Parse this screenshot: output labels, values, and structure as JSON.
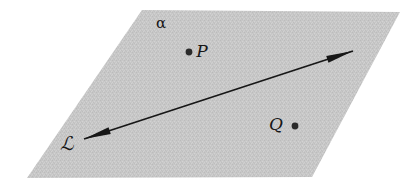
{
  "figure": {
    "type": "geometry-diagram",
    "background_color": "#ffffff",
    "ink_color": "#171717"
  },
  "plane": {
    "name": "plane-alpha",
    "label": "α",
    "fill_color": "#c8c8c8",
    "texture": "dithered-halftone",
    "corners": [
      {
        "name": "top-left",
        "x": 142,
        "y": 10
      },
      {
        "name": "top-right",
        "x": 400,
        "y": 12
      },
      {
        "name": "bottom-right",
        "x": 312,
        "y": 177
      },
      {
        "name": "bottom-left",
        "x": 27,
        "y": 178
      }
    ],
    "label_position": {
      "x": 161,
      "y": 23
    }
  },
  "points": [
    {
      "name": "point-P",
      "label": "P",
      "dot": {
        "x": 189,
        "y": 52,
        "r": 3.4
      },
      "label_position": {
        "x": 202,
        "y": 51
      },
      "label_side": "right"
    },
    {
      "name": "point-Q",
      "label": "Q",
      "dot": {
        "x": 295,
        "y": 126,
        "r": 3.4
      },
      "label_position": {
        "x": 276,
        "y": 124
      },
      "label_side": "left"
    }
  ],
  "line": {
    "name": "line-L",
    "label": "ℒ",
    "label_position": {
      "x": 67,
      "y": 143
    },
    "stroke_color": "#171717",
    "stroke_width": 1.8,
    "arrowheads": "both",
    "start": {
      "x": 84,
      "y": 139
    },
    "end": {
      "x": 353,
      "y": 51
    }
  }
}
